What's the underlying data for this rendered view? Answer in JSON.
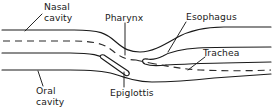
{
  "diagram": {
    "type": "anatomical-line-diagram",
    "background_color": "#ffffff",
    "line_color": "#1a1a1a",
    "labels": [
      {
        "id": "nasal-cavity",
        "text_line1": "Nasal",
        "text_line2": "cavity",
        "text": "Nasal cavity"
      },
      {
        "id": "pharynx",
        "text_line1": "Pharynx",
        "text_line2": "",
        "text": "Pharynx"
      },
      {
        "id": "esophagus",
        "text_line1": "Esophagus",
        "text_line2": "",
        "text": "Esophagus"
      },
      {
        "id": "trachea",
        "text_line1": "Trachea",
        "text_line2": "",
        "text": "Trachea"
      },
      {
        "id": "epiglottis",
        "text_line1": "Epiglottis",
        "text_line2": "",
        "text": "Epiglottis"
      },
      {
        "id": "oral-cavity",
        "text_line1": "Oral",
        "text_line2": "cavity",
        "text": "Oral cavity"
      }
    ]
  },
  "labels": {
    "nasal_line1": "Nasal",
    "nasal_line2": "cavity",
    "pharynx": "Pharynx",
    "esophagus": "Esophagus",
    "trachea": "Trachea",
    "epiglottis": "Epiglottis",
    "oral_line1": "Oral",
    "oral_line2": "cavity"
  }
}
